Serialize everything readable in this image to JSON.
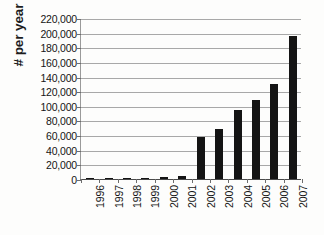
{
  "chart_data": {
    "type": "bar",
    "title": "",
    "xlabel": "",
    "ylabel": "# per year",
    "categories": [
      "1996",
      "1997",
      "1998",
      "1999",
      "2000",
      "2001",
      "2002",
      "2003",
      "2004",
      "2005",
      "2006",
      "2007"
    ],
    "values": [
      200,
      400,
      900,
      1800,
      3000,
      4600,
      57000,
      69000,
      94000,
      108000,
      130000,
      196000
    ],
    "ylim": [
      0,
      220000
    ],
    "ytick_step": 20000,
    "ytick_labels": [
      "220,000",
      "200,000",
      "180,000",
      "160,000",
      "140,000",
      "120,000",
      "100,000",
      "80,000",
      "60,000",
      "40,000",
      "20,000",
      "0"
    ],
    "ytick_values": [
      220000,
      200000,
      180000,
      160000,
      140000,
      120000,
      100000,
      80000,
      60000,
      40000,
      20000,
      0
    ],
    "grid": true,
    "grid_axis": "y",
    "legend": false,
    "legend_position": "none",
    "bar_color": "#141414",
    "gridline_color": "#a8a8a8",
    "axis_color": "#4a4a4a",
    "text_color": "#151515",
    "background_color": "#fdfdfc",
    "xtick_rotation": 90
  }
}
